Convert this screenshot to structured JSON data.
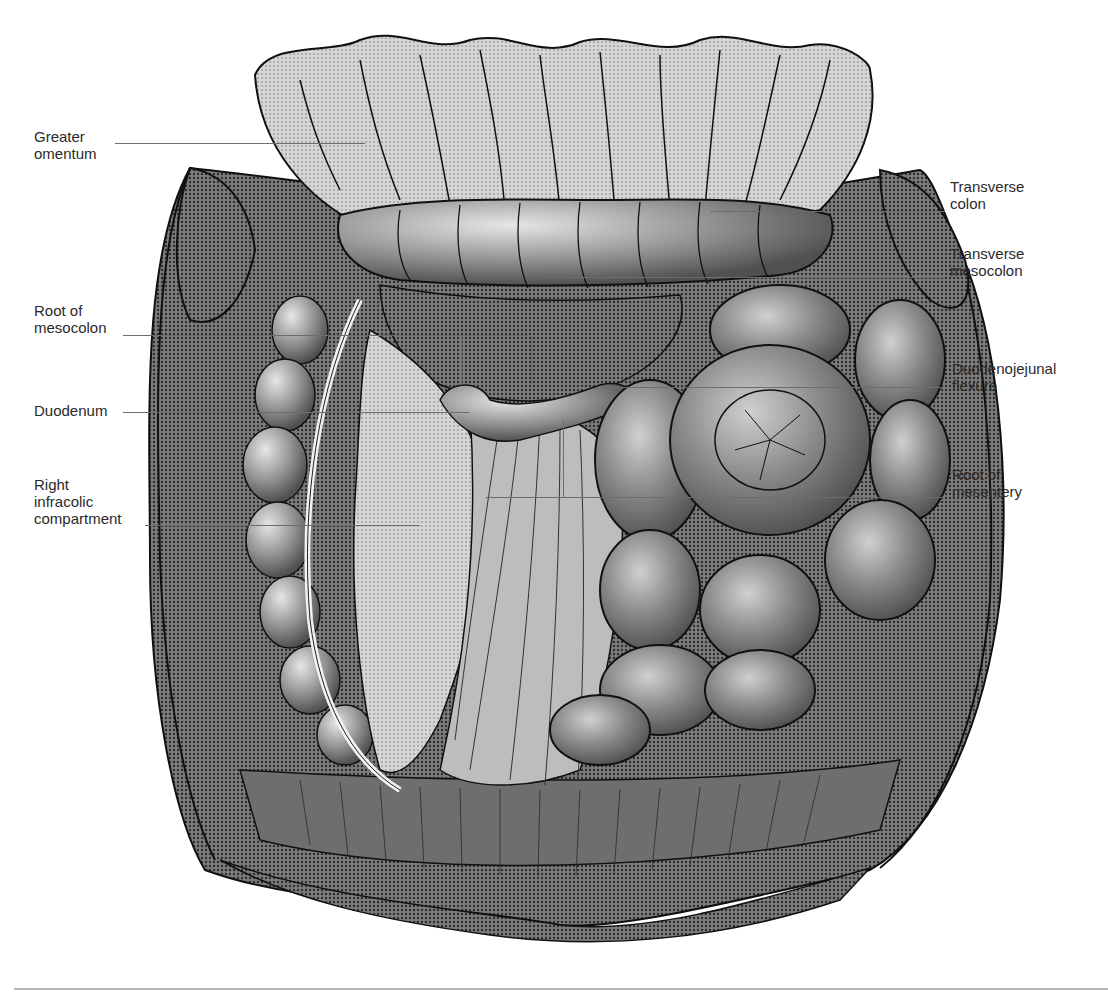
{
  "figure": {
    "labels_left": [
      {
        "id": "greater-omentum",
        "text": "Greater\nomentum",
        "x": 34,
        "y": 68,
        "line": {
          "x1": 115,
          "x2": 365,
          "y": 143
        }
      },
      {
        "id": "root-of-mesocolon",
        "text": "Root of\nmesocolon",
        "x": 34,
        "y": 302,
        "line": {
          "x1": 123,
          "x2": 530,
          "y": 335
        }
      },
      {
        "id": "duodenum",
        "text": "Duodenum",
        "x": 34,
        "y": 375,
        "line": {
          "x1": 123,
          "x2": 470,
          "y": 412
        }
      },
      {
        "id": "right-infracolic-compartment",
        "text": "Right\ninfracolic\ncompartment",
        "x": 34,
        "y": 476,
        "line": {
          "x1": 145,
          "x2": 420,
          "y": 525
        }
      }
    ],
    "labels_right": [
      {
        "id": "transverse-colon",
        "text": "Transverse\ncolon",
        "x": 950,
        "y": 175,
        "line": {
          "x1": 710,
          "x2": 945,
          "y": 211
        }
      },
      {
        "id": "transverse-mesocolon",
        "text": "Transverse\nmesocolon",
        "x": 950,
        "y": 243,
        "line": {
          "x1": 545,
          "x2": 945,
          "y": 277
        }
      },
      {
        "id": "duodenojejunal-flexure",
        "text": "Duodenojejunal\nflexure",
        "x": 952,
        "y": 357,
        "line": {
          "x1": 612,
          "x2": 945,
          "y": 387
        }
      },
      {
        "id": "root-of-mesentery",
        "text": "Root of\nmesentery",
        "x": 952,
        "y": 462,
        "line": {
          "x1": 486,
          "x2": 945,
          "y": 497
        }
      }
    ],
    "colors": {
      "label_text": "#2a2a2a",
      "leader_line": "#6d6d6d",
      "tissue_dark": "#5a5a5a",
      "tissue_mid": "#8c8c8c",
      "tissue_light": "#c9c9c9",
      "outline": "#111111",
      "bottom_rule": "#b8b8b8"
    }
  }
}
